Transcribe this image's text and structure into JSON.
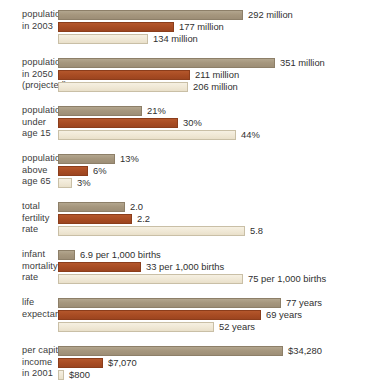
{
  "chart_data": {
    "type": "bar",
    "orientation": "horizontal",
    "title": "",
    "subtitle": "",
    "xlabel": "",
    "ylabel": "",
    "grid": false,
    "legend_position": "none",
    "series": [
      {
        "name": "series-1",
        "color": "#a6977e"
      },
      {
        "name": "series-2",
        "color": "#a84c23"
      },
      {
        "name": "series-3",
        "color": "#efe7d4"
      }
    ],
    "categories": [
      "population in 2003",
      "population in 2050 (projected)",
      "population under age 15",
      "population above age 65",
      "total fertility rate",
      "infant mortality rate",
      "life expectancy",
      "per capita income in 2001"
    ],
    "groups": [
      {
        "label_lines": [
          "population",
          "in 2003"
        ],
        "bars": [
          {
            "value": 292,
            "label": "292 million",
            "width_px": 185
          },
          {
            "value": 177,
            "label": "177 million",
            "width_px": 116
          },
          {
            "value": 134,
            "label": "134 million",
            "width_px": 90
          }
        ]
      },
      {
        "label_lines": [
          "population",
          "in 2050",
          "(projected)"
        ],
        "bars": [
          {
            "value": 351,
            "label": "351 million",
            "width_px": 217
          },
          {
            "value": 211,
            "label": "211 million",
            "width_px": 132
          },
          {
            "value": 206,
            "label": "206 million",
            "width_px": 130
          }
        ]
      },
      {
        "label_lines": [
          "population",
          "under",
          "age 15"
        ],
        "bars": [
          {
            "value": 21,
            "label": "21%",
            "width_px": 84
          },
          {
            "value": 30,
            "label": "30%",
            "width_px": 120
          },
          {
            "value": 44,
            "label": "44%",
            "width_px": 178
          }
        ]
      },
      {
        "label_lines": [
          "population",
          "above",
          "age 65"
        ],
        "bars": [
          {
            "value": 13,
            "label": "13%",
            "width_px": 57
          },
          {
            "value": 6,
            "label": "6%",
            "width_px": 30
          },
          {
            "value": 3,
            "label": "3%",
            "width_px": 14
          }
        ]
      },
      {
        "label_lines": [
          "total",
          "fertility",
          "rate"
        ],
        "bars": [
          {
            "value": 2.0,
            "label": "2.0",
            "width_px": 67
          },
          {
            "value": 2.2,
            "label": "2.2",
            "width_px": 74
          },
          {
            "value": 5.8,
            "label": "5.8",
            "width_px": 187
          }
        ]
      },
      {
        "label_lines": [
          "infant",
          "mortality",
          "rate"
        ],
        "bars": [
          {
            "value": 6.9,
            "label": "6.9 per 1,000 births",
            "width_px": 17
          },
          {
            "value": 33,
            "label": "33 per 1,000 births",
            "width_px": 83
          },
          {
            "value": 75,
            "label": "75 per 1,000 births",
            "width_px": 185
          }
        ]
      },
      {
        "label_lines": [
          "life",
          "expectancy"
        ],
        "bars": [
          {
            "value": 77,
            "label": "77 years",
            "width_px": 223
          },
          {
            "value": 69,
            "label": "69 years",
            "width_px": 203
          },
          {
            "value": 52,
            "label": "52 years",
            "width_px": 156
          }
        ]
      },
      {
        "label_lines": [
          "per capita",
          "income",
          "in 2001"
        ],
        "bars": [
          {
            "value": 34280,
            "label": "$34,280",
            "width_px": 225
          },
          {
            "value": 7070,
            "label": "$7,070",
            "width_px": 45
          },
          {
            "value": 800,
            "label": "$800",
            "width_px": 6
          }
        ]
      }
    ]
  }
}
